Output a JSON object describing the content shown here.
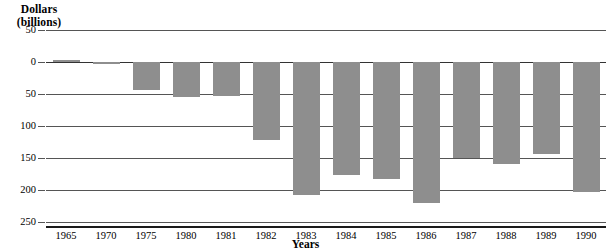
{
  "chart_data": {
    "type": "bar",
    "title": "",
    "ylabel": "Dollars (billions)",
    "ylabel_line1": "Dollars",
    "ylabel_line2": "(billions)",
    "xlabel": "Years",
    "categories": [
      "1965",
      "1970",
      "1975",
      "1980",
      "1981",
      "1982",
      "1983",
      "1984",
      "1985",
      "1986",
      "1987",
      "1988",
      "1989",
      "1990"
    ],
    "values": [
      3,
      -3,
      -43,
      -55,
      -53,
      -122,
      -208,
      -176,
      -183,
      -221,
      -150,
      -160,
      -144,
      -203
    ],
    "ylim": [
      -250,
      50
    ],
    "ytick_labels": [
      "50",
      "0",
      "50",
      "100",
      "150",
      "200",
      "250"
    ],
    "ytick_values": [
      50,
      0,
      -50,
      -100,
      -150,
      -200,
      -250
    ],
    "grid": true,
    "legend": "none",
    "bar_color": "#8e8e8e",
    "axis_color": "#555555",
    "background": "#ffffff"
  }
}
